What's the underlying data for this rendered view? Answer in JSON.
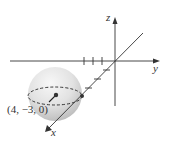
{
  "diagram": {
    "type": "3d-coordinate-sphere",
    "axes": {
      "x_label": "x",
      "y_label": "y",
      "z_label": "z"
    },
    "point_label": "(4, −3, 0)",
    "colors": {
      "axis": "#333333",
      "sphere_light": "#f4f4f4",
      "sphere_dark": "#bdbdbd",
      "text": "#333333"
    }
  }
}
